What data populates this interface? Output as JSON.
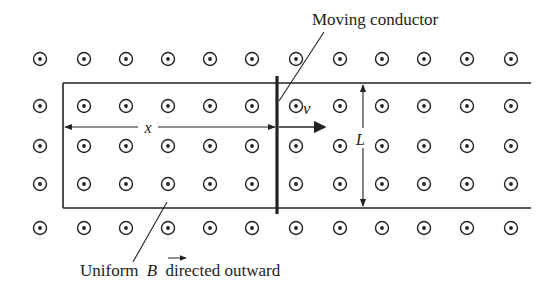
{
  "diagram": {
    "labels": {
      "conductor": "Moving conductor",
      "field": "Uniform",
      "field_symbol": "B",
      "field_suffix": "directed outward",
      "distance": "x",
      "velocity": "v",
      "length": "L"
    },
    "field_symbol": "dot-in-circle (field out of page)",
    "grid": {
      "rows_y": [
        59,
        106,
        146,
        184,
        228
      ],
      "cols_x": [
        40,
        84,
        126,
        168,
        210,
        252,
        296,
        340,
        382,
        424,
        467,
        511
      ]
    },
    "colors": {
      "ink": "#222222",
      "background": "#ffffff"
    }
  }
}
